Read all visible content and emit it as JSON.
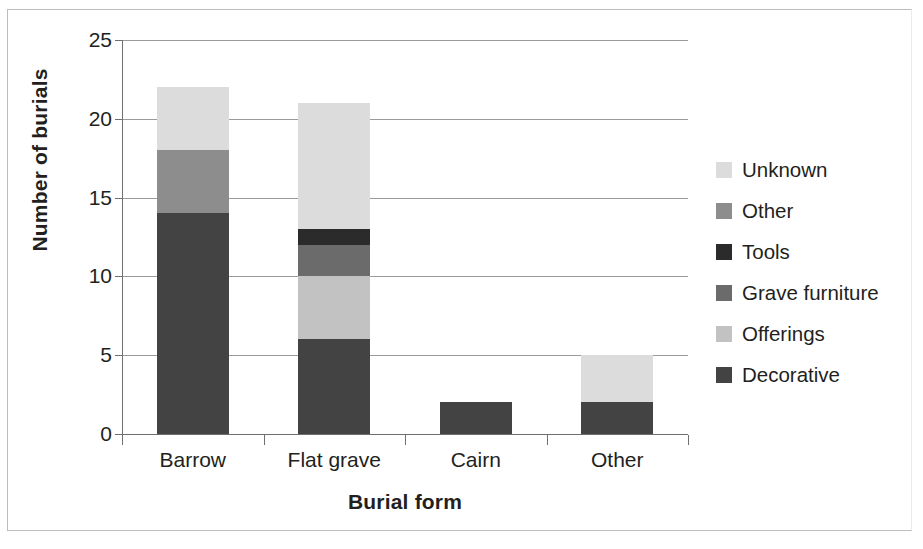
{
  "chart_data": {
    "type": "bar",
    "stacked": true,
    "title": "",
    "xlabel": "Burial form",
    "ylabel": "Number of burials",
    "categories": [
      "Barrow",
      "Flat grave",
      "Cairn",
      "Other"
    ],
    "ylim": [
      0,
      25
    ],
    "ytick_labels": [
      "0",
      "5",
      "10",
      "15",
      "20",
      "25"
    ],
    "ytick_values": [
      0,
      5,
      10,
      15,
      20,
      25
    ],
    "grid": "horizontal",
    "legend_position": "right",
    "series": [
      {
        "name": "Decorative",
        "color": "#434343",
        "values": [
          14,
          6,
          2,
          2
        ]
      },
      {
        "name": "Offerings",
        "color": "#c2c2c2",
        "values": [
          0,
          4,
          0,
          0
        ]
      },
      {
        "name": "Grave furniture",
        "color": "#6b6b6b",
        "values": [
          0,
          2,
          0,
          0
        ]
      },
      {
        "name": "Tools",
        "color": "#2b2b2b",
        "values": [
          0,
          1,
          0,
          0
        ]
      },
      {
        "name": "Other",
        "color": "#8d8d8d",
        "values": [
          4,
          0,
          0,
          0
        ]
      },
      {
        "name": "Unknown",
        "color": "#dcdcdc",
        "values": [
          4,
          8,
          0,
          3
        ]
      }
    ],
    "totals": [
      22,
      21,
      2,
      5
    ]
  },
  "axes": {
    "y_title": "Number of burials",
    "x_title": "Burial form",
    "y_ticks": [
      {
        "label": "25",
        "value": 25
      },
      {
        "label": "20",
        "value": 20
      },
      {
        "label": "15",
        "value": 15
      },
      {
        "label": "10",
        "value": 10
      },
      {
        "label": "5",
        "value": 5
      },
      {
        "label": "0",
        "value": 0
      }
    ],
    "x_categories": [
      {
        "label": "Barrow"
      },
      {
        "label": "Flat grave"
      },
      {
        "label": "Cairn"
      },
      {
        "label": "Other"
      }
    ]
  },
  "legend": {
    "items": [
      {
        "label": "Unknown",
        "color": "#dcdcdc"
      },
      {
        "label": "Other",
        "color": "#8d8d8d"
      },
      {
        "label": "Tools",
        "color": "#2b2b2b"
      },
      {
        "label": "Grave furniture",
        "color": "#6b6b6b"
      },
      {
        "label": "Offerings",
        "color": "#c2c2c2"
      },
      {
        "label": "Decorative",
        "color": "#434343"
      }
    ]
  }
}
